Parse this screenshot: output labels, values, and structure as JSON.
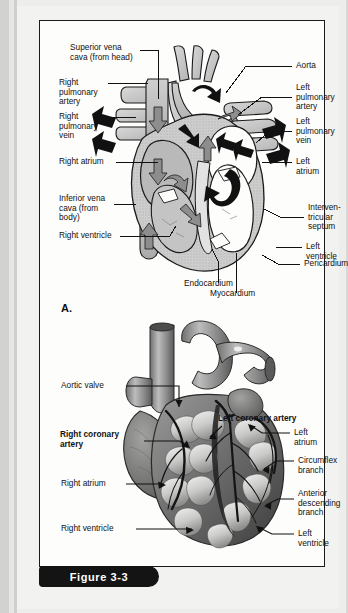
{
  "figure": {
    "caption": "Figure 3-3"
  },
  "panels": [
    {
      "letter": "A.",
      "labels": [
        {
          "name": "superior-vena-cava",
          "text": "Superior vena\ncava (from head)"
        },
        {
          "name": "right-pulmonary-artery",
          "text": "Right\npulmonary\nartery"
        },
        {
          "name": "right-pulmonary-vein",
          "text": "Right\npulmonary\nvein"
        },
        {
          "name": "right-atrium",
          "text": "Right atrium"
        },
        {
          "name": "inferior-vena-cava",
          "text": "Inferior vena\ncava (from\nbody)"
        },
        {
          "name": "right-ventricle",
          "text": "Right ventricle"
        },
        {
          "name": "aorta",
          "text": "Aorta"
        },
        {
          "name": "left-pulmonary-artery",
          "text": "Left\npulmonary\nartery"
        },
        {
          "name": "left-pulmonary-vein",
          "text": "Left\npulmonary\nvein"
        },
        {
          "name": "left-atrium",
          "text": "Left atrium"
        },
        {
          "name": "interventricular-septum",
          "text": "Interven-\ntricular\nseptum"
        },
        {
          "name": "left-ventricle",
          "text": "Left ventricle"
        },
        {
          "name": "pericardium",
          "text": "Pericardium"
        },
        {
          "name": "endocardium",
          "text": "Endocardium"
        },
        {
          "name": "myocardium",
          "text": "Myocardium"
        }
      ]
    },
    {
      "letter": "B.",
      "labels": [
        {
          "name": "aortic-valve",
          "text": "Aortic valve"
        },
        {
          "name": "right-coronary-artery",
          "text": "Right coronary\nartery",
          "bold": true
        },
        {
          "name": "right-atrium",
          "text": "Right atrium"
        },
        {
          "name": "right-ventricle",
          "text": "Right ventricle"
        },
        {
          "name": "left-coronary-artery",
          "text": "Left coronary artery",
          "bold": true
        },
        {
          "name": "left-atrium",
          "text": "Left atrium"
        },
        {
          "name": "circumflex-branch",
          "text": "Circumflex\nbranch"
        },
        {
          "name": "anterior-descending-branch",
          "text": "Anterior\ndescending\nbranch"
        },
        {
          "name": "left-ventricle",
          "text": "Left\nventricle"
        }
      ]
    }
  ]
}
